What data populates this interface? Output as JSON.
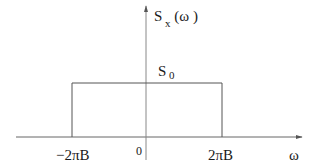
{
  "diagram": {
    "y_axis_label": {
      "main": "S",
      "sub": "x",
      "arg": "(ω )"
    },
    "level_label": {
      "main": "S",
      "sub": "0"
    },
    "x_axis_label": "ω",
    "ticks": {
      "left": "−2πB",
      "origin": "0",
      "right": "2πB"
    },
    "colors": {
      "line": "#555555",
      "text": "#1a1a1a"
    }
  }
}
